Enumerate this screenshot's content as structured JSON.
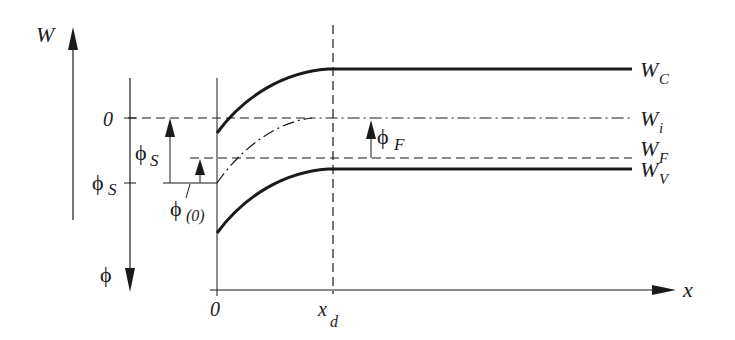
{
  "diagram": {
    "axes": {
      "energy_axis_label": "W",
      "potential_axis_label": "ϕ",
      "position_axis_label": "x",
      "potential_zero_label": "0",
      "potential_surface_label": "ϕ",
      "potential_surface_sub": "S",
      "x_origin_label": "0",
      "x_depletion_label": "x",
      "x_depletion_sub": "d"
    },
    "bands": {
      "conduction": {
        "label": "W",
        "sub": "C",
        "style": "solid-thick"
      },
      "intrinsic": {
        "label": "W",
        "sub": "i",
        "style": "dash-dot"
      },
      "fermi": {
        "label": "W",
        "sub": "F",
        "style": "dashed"
      },
      "valence": {
        "label": "W",
        "sub": "V",
        "style": "solid-thick"
      }
    },
    "annotations": {
      "phi_s_arrow": {
        "label": "ϕ",
        "sub": "S"
      },
      "phi_0_arrow": {
        "label": "ϕ",
        "sub": "(0)"
      },
      "phi_f_arrow": {
        "label": "ϕ",
        "sub": "F"
      }
    },
    "colors": {
      "ink": "#1a1a1a",
      "background": "#ffffff"
    }
  }
}
